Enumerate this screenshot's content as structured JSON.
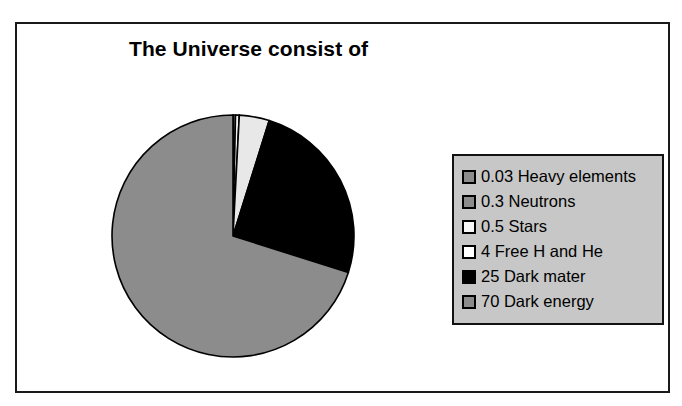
{
  "chart_data": {
    "type": "pie",
    "title": "The Universe consist of",
    "xlabel": "",
    "ylabel": "",
    "legend_position": "right",
    "grid": false,
    "start_angle_deg": 0,
    "direction": "clockwise",
    "categories": [
      "0.03 Heavy elements",
      "0.3 Neutrons",
      "0.5 Stars",
      "4 Free H and He",
      "25 Dark mater",
      "70 Dark energy"
    ],
    "values": [
      0.03,
      0.3,
      0.5,
      4,
      25,
      70
    ],
    "slice_colors": [
      "#8c8c8c",
      "#8c8c8c",
      "#f2f2f2",
      "#e8e8e8",
      "#000000",
      "#8c8c8c"
    ],
    "slice_outline": "#000000",
    "labels": [
      "0.03 Heavy elements",
      "0.3 Neutrons",
      "0.5 Stars",
      "4 Free H and He",
      "25 Dark mater",
      "70 Dark energy"
    ]
  },
  "legend": {
    "background": "#c7c7c7",
    "border": "#111111",
    "items": [
      {
        "label": "0.03 Heavy elements",
        "swatch": "#8c8c8c"
      },
      {
        "label": "0.3 Neutrons",
        "swatch": "#8c8c8c"
      },
      {
        "label": "0.5 Stars",
        "swatch": "#f7f7f7"
      },
      {
        "label": "4 Free H and He",
        "swatch": "#ffffff"
      },
      {
        "label": "25 Dark mater",
        "swatch": "#000000"
      },
      {
        "label": "70 Dark energy",
        "swatch": "#8c8c8c"
      }
    ]
  },
  "frame": {
    "border_color": "#1a1a1a",
    "background": "#ffffff"
  }
}
